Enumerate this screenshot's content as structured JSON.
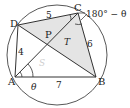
{
  "diagram": {
    "type": "cyclic-quadrilateral",
    "points": {
      "A": {
        "label": "A"
      },
      "B": {
        "label": "B"
      },
      "C": {
        "label": "C"
      },
      "D": {
        "label": "D"
      },
      "P": {
        "label": "P"
      }
    },
    "sides": {
      "DC": "5",
      "AD": "4",
      "CB": "6",
      "AB": "7"
    },
    "angles": {
      "A": "θ",
      "C": "180° − θ"
    },
    "regions": {
      "S": "S",
      "T": "T"
    },
    "colors": {
      "stroke": "#333333",
      "shade": "#e4e4e4"
    }
  }
}
